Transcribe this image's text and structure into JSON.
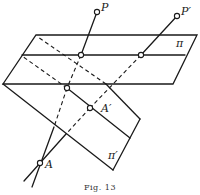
{
  "figure": {
    "caption": "Fig. 13",
    "labels": {
      "P": "P",
      "P_prime": "P′",
      "pi": "π",
      "pi_prime": "π′",
      "A": "A",
      "A_prime": "A′"
    }
  },
  "colors": {
    "ink": "#1a1a1a",
    "background": "#ffffff"
  }
}
